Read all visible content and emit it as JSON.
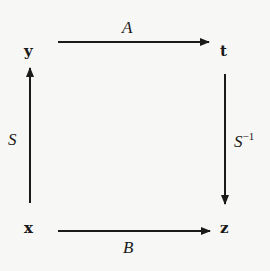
{
  "nodes": {
    "y": "y",
    "t": "t",
    "x": "x",
    "z": "z"
  },
  "arrows": {
    "top": {
      "label": "A",
      "from": "y",
      "to": "t"
    },
    "left": {
      "label": "S",
      "from": "x",
      "to": "y"
    },
    "right": {
      "label": "S",
      "sup": "−1",
      "from": "t",
      "to": "z"
    },
    "bottom": {
      "label": "B",
      "from": "x",
      "to": "z"
    }
  },
  "colors": {
    "ink": "#1a1a1a",
    "background": "#f7f7f5"
  }
}
